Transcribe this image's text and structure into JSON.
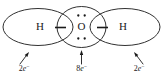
{
  "diagram": {
    "stroke_color": "#1a1a1a",
    "background_color": "#ffffff",
    "atoms": [
      {
        "id": "hydrogen-left",
        "symbol": "H",
        "cx": 40,
        "cy": 27
      },
      {
        "id": "oxygen-center",
        "symbol": "O",
        "cx": 81.5,
        "cy": 27
      },
      {
        "id": "hydrogen-right",
        "symbol": "H",
        "cx": 123,
        "cy": 27
      }
    ],
    "shells": [
      {
        "id": "shell-hydrogen-left",
        "cx": 38,
        "cy": 27,
        "rx": 35,
        "ry": 18.5
      },
      {
        "id": "shell-oxygen-center",
        "cx": 81.5,
        "cy": 27,
        "rx": 24.5,
        "ry": 20.5
      },
      {
        "id": "shell-hydrogen-right",
        "cx": 125,
        "cy": 27,
        "rx": 35,
        "ry": 18.5
      }
    ],
    "bond_pairs": [
      {
        "id": "bond-pair-left",
        "cx": 60.5,
        "cy": 27.5,
        "half_width": 5.5
      },
      {
        "id": "bond-pair-right",
        "cx": 102.5,
        "cy": 27.5,
        "half_width": 5.5
      }
    ],
    "lone_pairs": [
      {
        "id": "lone-pair-top",
        "cx": 81.5,
        "cy": 15.5,
        "dot_gap": 3.2,
        "dot_r": 1.15
      },
      {
        "id": "lone-pair-bottom",
        "cx": 81.5,
        "cy": 38.5,
        "dot_gap": 3.2,
        "dot_r": 1.15
      }
    ],
    "callouts": [
      {
        "id": "callout-left",
        "number": "2",
        "symbol": "e",
        "charge": "−",
        "text": "2e−",
        "label_x": 24,
        "label_y": 71,
        "tail_x": 20,
        "tail_y": 64,
        "tip_x": 29,
        "tip_y": 52
      },
      {
        "id": "callout-center",
        "number": "8",
        "symbol": "e",
        "charge": "−",
        "text": "8e−",
        "label_x": 81.5,
        "label_y": 71,
        "tail_x": 81.5,
        "tail_y": 64,
        "tip_x": 81.5,
        "tip_y": 50
      },
      {
        "id": "callout-right",
        "number": "2",
        "symbol": "e",
        "charge": "−",
        "text": "2e−",
        "label_x": 139,
        "label_y": 71,
        "tail_x": 143,
        "tail_y": 64,
        "tip_x": 134,
        "tip_y": 52
      }
    ]
  }
}
